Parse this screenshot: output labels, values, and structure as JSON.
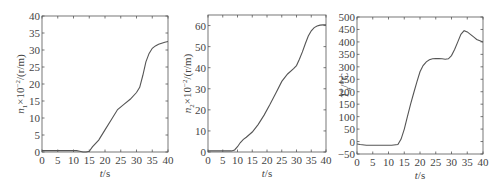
{
  "chart_data": [
    {
      "type": "line",
      "title": "",
      "xlabel": "t/s",
      "ylabel": "n1×10^-2/(r/m)",
      "xlim": [
        0,
        40
      ],
      "ylim": [
        0,
        40
      ],
      "xticks": [
        0,
        5,
        10,
        15,
        20,
        25,
        30,
        35,
        40
      ],
      "yticks": [
        0,
        5,
        10,
        15,
        20,
        25,
        30,
        35,
        40
      ],
      "grid": false,
      "series": [
        {
          "name": "n1",
          "x": [
            0,
            2,
            5,
            8,
            11,
            12,
            13,
            14,
            15,
            16,
            18,
            20,
            22,
            24,
            26,
            28,
            30,
            31,
            32,
            33,
            34,
            35,
            36,
            37,
            38,
            39,
            40
          ],
          "y": [
            0.4,
            0.4,
            0.4,
            0.4,
            0.4,
            0.2,
            0.0,
            0.0,
            0.2,
            1.5,
            3.5,
            6.5,
            9.5,
            12.5,
            14.0,
            15.5,
            17.5,
            19.0,
            22.5,
            26.5,
            29.0,
            30.5,
            31.2,
            31.7,
            32.0,
            32.3,
            32.5
          ]
        }
      ]
    },
    {
      "type": "line",
      "title": "",
      "xlabel": "t/s",
      "ylabel": "n2×10^-2/(r/m)",
      "xlim": [
        0,
        40
      ],
      "ylim": [
        0,
        65
      ],
      "xticks": [
        0,
        5,
        10,
        15,
        20,
        25,
        30,
        35,
        40
      ],
      "yticks": [
        0,
        10,
        20,
        30,
        40,
        50,
        60
      ],
      "grid": false,
      "series": [
        {
          "name": "n2",
          "x": [
            0,
            2,
            5,
            8,
            9,
            10,
            11,
            12,
            13,
            15,
            17,
            19,
            21,
            23,
            25,
            27,
            29,
            30,
            31,
            32,
            33,
            34,
            35,
            36,
            37,
            38,
            39,
            40
          ],
          "y": [
            0.5,
            0.5,
            0.5,
            0.5,
            1.0,
            2.5,
            4.5,
            6.0,
            7.0,
            9.5,
            13.0,
            17.5,
            22.5,
            28.0,
            33.5,
            37.0,
            39.5,
            41.0,
            44.0,
            47.5,
            51.5,
            55.0,
            57.5,
            59.0,
            59.8,
            60.2,
            60.3,
            60.3
          ]
        }
      ]
    },
    {
      "type": "line",
      "title": "",
      "xlabel": "t/s",
      "ylabel": "T4*/°C",
      "xlim": [
        0,
        40
      ],
      "ylim": [
        -50,
        500
      ],
      "xticks": [
        0,
        5,
        10,
        15,
        20,
        25,
        30,
        35,
        40
      ],
      "yticks": [
        -50,
        0,
        50,
        100,
        150,
        200,
        250,
        300,
        350,
        400,
        450,
        500
      ],
      "grid": false,
      "series": [
        {
          "name": "T4*",
          "x": [
            0,
            1,
            3,
            5,
            8,
            11,
            13,
            14,
            15,
            16,
            17,
            18,
            19,
            20,
            21,
            22,
            23,
            24,
            25,
            26,
            27,
            28,
            29,
            30,
            31,
            32,
            33,
            34,
            35,
            36,
            37,
            38,
            39,
            40
          ],
          "y": [
            -10,
            -12,
            -15,
            -15,
            -15,
            -15,
            -12,
            10,
            50,
            100,
            150,
            195,
            240,
            280,
            305,
            320,
            328,
            332,
            333,
            333,
            332,
            330,
            332,
            345,
            370,
            400,
            430,
            445,
            440,
            430,
            420,
            410,
            405,
            400
          ]
        }
      ]
    }
  ],
  "plots": [
    {
      "xlabel_t": "t",
      "xlabel_unit": "/s",
      "ylabel_sym": "n",
      "ylabel_sub": "1",
      "ylabel_rest": "×10",
      "ylabel_exp": "−2",
      "ylabel_unit": "/(r/m)"
    },
    {
      "xlabel_t": "t",
      "xlabel_unit": "/s",
      "ylabel_sym": "n",
      "ylabel_sub": "2",
      "ylabel_rest": "×10",
      "ylabel_exp": "−2",
      "ylabel_unit": "/(r/m)"
    },
    {
      "xlabel_t": "t",
      "xlabel_unit": "/s",
      "ylabel_sym": "T",
      "ylabel_sub": "4",
      "ylabel_sup": "*",
      "ylabel_unit": "/°C"
    }
  ]
}
